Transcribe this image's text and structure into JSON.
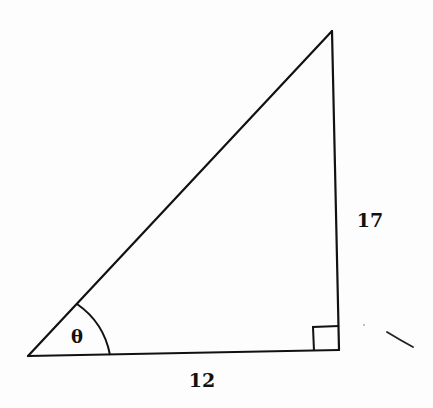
{
  "diagram": {
    "type": "right-triangle",
    "colors": {
      "stroke": "#111111",
      "background": "#fdfdfd"
    },
    "vertices": {
      "bottom_left": [
        28,
        356
      ],
      "bottom_right": [
        339,
        350
      ],
      "top": [
        332,
        31
      ]
    },
    "labels": {
      "angle": "θ",
      "vertical_side": "17",
      "horizontal_side": "12"
    },
    "markers": {
      "right_angle_at": "bottom_right",
      "angle_arc_at": "bottom_left"
    }
  }
}
